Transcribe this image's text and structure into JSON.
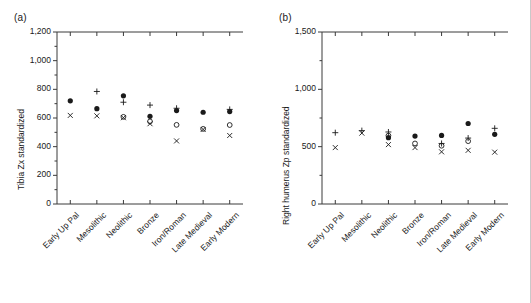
{
  "figure": {
    "background": "#ffffff",
    "axis_color": "#3a3a3a",
    "marker_color": "#1a1a1a"
  },
  "categories": [
    "Early Up Pal",
    "Mesolithic",
    "Neolithic",
    "Bronze",
    "Iron/Roman",
    "Late Medieval",
    "Early Modern"
  ],
  "series_names": [
    "filled-circle",
    "plus",
    "open-circle",
    "cross"
  ],
  "panels": [
    {
      "id": "a",
      "label": "(a)",
      "ylabel": "Tibia Zx standardized",
      "ytick_labels": [
        "0",
        "200",
        "400",
        "600",
        "800",
        "1,000",
        "1,200"
      ]
    },
    {
      "id": "b",
      "label": "(b)",
      "ylabel": "Right humerus Zp standardized",
      "ytick_labels": [
        "0",
        "500",
        "1,000",
        "1,500"
      ]
    }
  ],
  "chart_data": [
    {
      "type": "scatter",
      "panel": "a",
      "title": "(a)",
      "xlabel": "",
      "ylabel": "Tibia Zx standardized",
      "ylim": [
        0,
        1200
      ],
      "yticks": [
        0,
        200,
        400,
        600,
        800,
        1000,
        1200
      ],
      "minor_ticks": true,
      "grid": false,
      "legend": "none",
      "categories": [
        "Early Up Pal",
        "Mesolithic",
        "Neolithic",
        "Bronze",
        "Iron/Roman",
        "Late Medieval",
        "Early Modern"
      ],
      "series": [
        {
          "name": "filled-circle",
          "marker": "filled-circle",
          "values": [
            720,
            665,
            755,
            612,
            652,
            640,
            645
          ]
        },
        {
          "name": "plus",
          "marker": "plus",
          "values": [
            null,
            785,
            710,
            690,
            668,
            null,
            660
          ]
        },
        {
          "name": "open-circle",
          "marker": "open-circle",
          "values": [
            null,
            null,
            608,
            576,
            552,
            524,
            551
          ]
        },
        {
          "name": "cross",
          "marker": "cross",
          "values": [
            618,
            615,
            602,
            560,
            440,
            520,
            478
          ]
        }
      ]
    },
    {
      "type": "scatter",
      "panel": "b",
      "title": "(b)",
      "xlabel": "",
      "ylabel": "Right humerus Zp standardized",
      "ylim": [
        0,
        1500
      ],
      "yticks": [
        0,
        500,
        1000,
        1500
      ],
      "minor_ticks": true,
      "grid": false,
      "legend": "none",
      "categories": [
        "Early Up Pal",
        "Mesolithic",
        "Neolithic",
        "Bronze",
        "Iron/Roman",
        "Late Medieval",
        "Early Modern"
      ],
      "series": [
        {
          "name": "filled-circle",
          "marker": "filled-circle",
          "values": [
            null,
            null,
            578,
            592,
            598,
            702,
            608
          ]
        },
        {
          "name": "plus",
          "marker": "plus",
          "values": [
            622,
            640,
            628,
            null,
            528,
            575,
            660
          ]
        },
        {
          "name": "open-circle",
          "marker": "open-circle",
          "values": [
            null,
            null,
            596,
            528,
            508,
            548,
            null
          ]
        },
        {
          "name": "cross",
          "marker": "cross",
          "values": [
            492,
            618,
            518,
            492,
            455,
            468,
            452
          ]
        }
      ]
    }
  ]
}
